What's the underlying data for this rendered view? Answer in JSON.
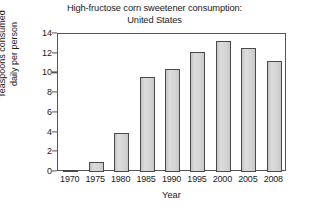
{
  "chart_data": {
    "type": "bar",
    "title": "High-fructose corn sweetener consumption: United States",
    "title_lines": [
      "High-fructose corn sweetener consumption:",
      "United States"
    ],
    "xlabel": "Year",
    "ylabel": "Teaspoons consumed daily per person",
    "ylabel_lines": [
      "Teaspoons consumed",
      "daily per person"
    ],
    "categories": [
      "1970",
      "1975",
      "1980",
      "1985",
      "1990",
      "1995",
      "2000",
      "2005",
      "2008"
    ],
    "values": [
      0.2,
      1.0,
      4.0,
      9.6,
      10.5,
      12.2,
      13.3,
      12.6,
      11.3
    ],
    "ylim": [
      0,
      14
    ],
    "ytick_values": [
      0,
      2,
      4,
      6,
      8,
      10,
      12,
      14
    ],
    "ytick_labels": [
      "0",
      "2",
      "4",
      "6",
      "8",
      "10",
      "12",
      "14"
    ],
    "grid": false,
    "legend": null,
    "bar_fill_color": "#d2d2d2",
    "bar_edge_color": "#4a4a4a",
    "frame_color": "#555555",
    "text_color": "#1a1a1a"
  }
}
